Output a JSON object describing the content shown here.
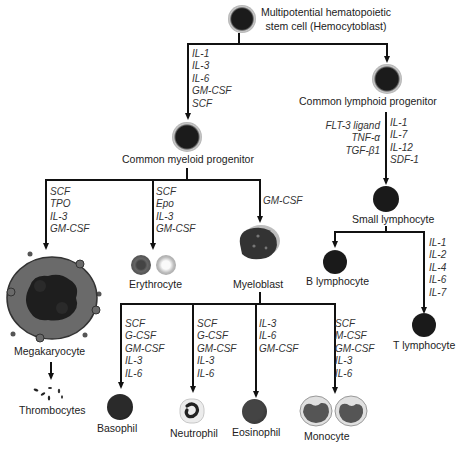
{
  "diagram": {
    "nodes": {
      "stem_cell": {
        "label_line1": "Multipotential hematopoietic",
        "label_line2": "stem cell (Hemocytoblast)"
      },
      "myeloid": {
        "label": "Common myeloid progenitor"
      },
      "lymphoid": {
        "label": "Common lymphoid progenitor"
      },
      "small_lymphocyte": {
        "label": "Small lymphocyte"
      },
      "b_lymphocyte": {
        "label": "B lymphocyte"
      },
      "t_lymphocyte": {
        "label": "T lymphocyte"
      },
      "megakaryocyte": {
        "label": "Megakaryocyte"
      },
      "thrombocytes": {
        "label": "Thrombocytes"
      },
      "erythrocyte": {
        "label": "Erythrocyte"
      },
      "myeloblast": {
        "label": "Myeloblast"
      },
      "basophil": {
        "label": "Basophil"
      },
      "neutrophil": {
        "label": "Neutrophil"
      },
      "eosinophil": {
        "label": "Eosinophil"
      },
      "monocyte": {
        "label": "Monocyte"
      }
    },
    "cytokines": {
      "stem_to_myeloid": "IL-1\nIL-3\nIL-6\nGM-CSF\nSCF",
      "lymphoid_left": "FLT-3 ligand\nTNF-α\nTGF-β1",
      "lymphoid_right": "IL-1\nIL-7\nIL-12\nSDF-1",
      "to_megakaryocyte": "SCF\nTPO\nIL-3\nGM-CSF",
      "to_erythrocyte": "SCF\nEpo\nIL-3\nGM-CSF",
      "to_myeloblast": "GM-CSF",
      "to_t_lymphocyte": "IL-1\nIL-2\nIL-4\nIL-6\nIL-7",
      "to_basophil": "SCF\nG-CSF\nGM-CSF\nIL-3\nIL-6",
      "to_neutrophil": "SCF\nG-CSF\nGM-CSF\nIL-3\nIL-6",
      "to_eosinophil": "IL-3\nIL-6\nGM-CSF",
      "to_monocyte": "SCF\nM-CSF\nGM-CSF\nIL-3\nIL-6"
    }
  }
}
